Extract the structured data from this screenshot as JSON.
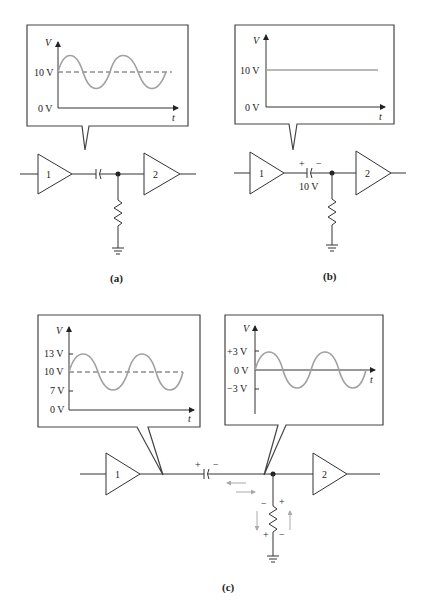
{
  "figure": {
    "panels": [
      {
        "id": "a",
        "caption": "(a)",
        "callout": {
          "y_axis_label": "V",
          "x_axis_label": "t",
          "ticks": [
            "10 V",
            "0 V"
          ],
          "waveform": "sine centered on 10 V (dashed line at 10 V)"
        },
        "amplifiers": [
          "1",
          "2"
        ]
      },
      {
        "id": "b",
        "caption": "(b)",
        "callout": {
          "y_axis_label": "V",
          "x_axis_label": "t",
          "ticks": [
            "10 V",
            "0 V"
          ],
          "waveform": "constant DC at 10 V"
        },
        "capacitor": {
          "plus": "+",
          "minus": "−",
          "voltage": "10 V"
        },
        "amplifiers": [
          "1",
          "2"
        ]
      },
      {
        "id": "c",
        "caption": "(c)",
        "callout_left": {
          "y_axis_label": "V",
          "x_axis_label": "t",
          "ticks": [
            "13 V",
            "10 V",
            "7 V",
            "0 V"
          ],
          "waveform": "sine 7 V to 13 V centered on 10 V (dashed)"
        },
        "callout_right": {
          "y_axis_label": "V",
          "x_axis_label": "t",
          "ticks": [
            "+3 V",
            "0 V",
            "−3 V"
          ],
          "waveform": "sine −3 V to +3 V centered on 0 V"
        },
        "capacitor": {
          "plus": "+",
          "minus": "−"
        },
        "resistor_polarity": {
          "top_left": "−",
          "top_right": "+",
          "bottom_left": "+",
          "bottom_right": "−"
        },
        "amplifiers": [
          "1",
          "2"
        ]
      }
    ]
  }
}
